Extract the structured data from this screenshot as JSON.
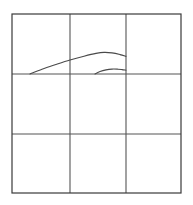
{
  "figure": {
    "title": "",
    "background_color": "#ffffff",
    "canvas": {
      "width": 193,
      "height": 205
    }
  },
  "chart_data": {
    "type": "line",
    "title": "",
    "subtitle": "",
    "xlabel": "",
    "ylabel": "",
    "grid": true,
    "legend": null,
    "legend_position": "none",
    "xlim": [
      0,
      3
    ],
    "ylim": [
      0,
      3
    ],
    "plot_box": {
      "left": 12,
      "top": 14,
      "right": 181,
      "bottom": 193,
      "border_color": "#3a3a3a",
      "border_width": 1.2
    },
    "grid_lines": {
      "color": "#555555",
      "width": 1.1,
      "vertical_x": [
        70,
        126
      ],
      "horizontal_y": [
        74,
        134
      ],
      "columns": 3,
      "rows": 3
    },
    "xticks": [
      0,
      1,
      2,
      3
    ],
    "xticklabels": [
      "",
      "",
      "",
      ""
    ],
    "yticks": [
      0,
      1,
      2,
      3
    ],
    "yticklabels": [
      "",
      "",
      "",
      ""
    ],
    "series": [
      {
        "name": "upper-arc",
        "color": "#4a4a4a",
        "width": 1.1,
        "style": "solid",
        "x": [
          30,
          42,
          55,
          70,
          84,
          96,
          104,
          112,
          120,
          126
        ],
        "y": [
          74.0,
          69.2,
          64.8,
          60.0,
          56.2,
          53.4,
          52.4,
          52.9,
          54.6,
          56.4
        ]
      },
      {
        "name": "lower-arc",
        "color": "#4a4a4a",
        "width": 1.1,
        "style": "solid",
        "x": [
          95,
          100,
          106,
          112,
          118,
          122,
          126
        ],
        "y": [
          74.0,
          71.6,
          69.9,
          69.1,
          69.2,
          69.6,
          70.2
        ]
      }
    ],
    "annotations": []
  }
}
